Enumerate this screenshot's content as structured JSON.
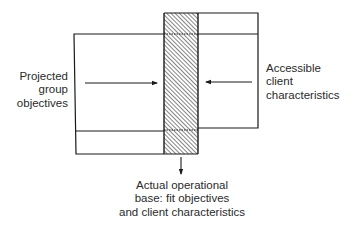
{
  "diagram": {
    "left_label": [
      "Projected",
      "group",
      "objectives"
    ],
    "right_label": [
      "Accessible",
      "client",
      "characteristics"
    ],
    "bottom_label": [
      "Actual operational",
      "base: fit objectives",
      "and client characteristics"
    ],
    "shapes": {
      "left_box": {
        "x1": 74,
        "y_top": 34,
        "y_mid": 131,
        "y_bottom": 154,
        "x2": 164
      },
      "right_box": {
        "x1": 198,
        "y_top": 13,
        "y_mid": 34,
        "y_bottom": 128,
        "x2": 258
      },
      "overlap_column": {
        "x": 164,
        "y": 13,
        "width": 34,
        "height": 141,
        "fill": "hatched"
      }
    },
    "arrows": [
      {
        "from": "left",
        "direction": "right"
      },
      {
        "from": "right",
        "direction": "left"
      },
      {
        "from": "column",
        "direction": "down"
      }
    ],
    "colors": {
      "line": "#1a1a1a",
      "hatch": "#555555",
      "background": "#ffffff",
      "text": "#2a2a2a"
    }
  }
}
